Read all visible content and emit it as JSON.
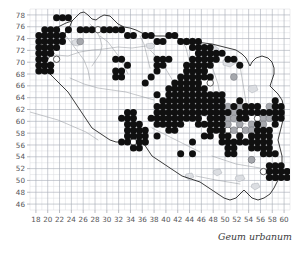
{
  "figure": {
    "caption": "Geum urbanum",
    "type": "species-distribution-grid-map"
  },
  "axes": {
    "x_ticks": [
      18,
      20,
      22,
      24,
      26,
      28,
      30,
      32,
      34,
      36,
      38,
      40,
      42,
      44,
      46,
      48,
      50,
      52,
      54,
      56,
      58,
      60
    ],
    "y_ticks": [
      78,
      76,
      74,
      72,
      70,
      68,
      66,
      64,
      62,
      60,
      58,
      56,
      54,
      52,
      50,
      48,
      46
    ],
    "x_range": [
      17,
      61
    ],
    "y_range": [
      45,
      79
    ],
    "grid": "on",
    "xlabel": "",
    "ylabel": ""
  },
  "legend": {
    "symbols": [
      {
        "name": "filled",
        "color": "#101010",
        "meaning": "recorded"
      },
      {
        "name": "gray",
        "color": "#a6a8ad",
        "meaning": "uncertain"
      },
      {
        "name": "open",
        "color": "#ffffff",
        "meaning": "old record"
      }
    ]
  },
  "chart_data": {
    "type": "scatter",
    "title": "Geum urbanum",
    "xlabel": "",
    "ylabel": "",
    "xlim": [
      17,
      61
    ],
    "ylim": [
      45,
      79
    ],
    "grid": true,
    "legend_position": "none",
    "series": [
      {
        "name": "filled",
        "marker": "filled-circle",
        "color": "#101010",
        "points": [
          [
            21,
            77
          ],
          [
            22,
            77
          ],
          [
            23,
            77
          ],
          [
            19,
            75
          ],
          [
            20,
            75
          ],
          [
            21,
            75
          ],
          [
            23,
            75
          ],
          [
            25,
            75
          ],
          [
            26,
            75
          ],
          [
            27,
            75
          ],
          [
            29,
            75
          ],
          [
            30,
            75
          ],
          [
            31,
            75
          ],
          [
            32,
            75
          ],
          [
            18,
            74
          ],
          [
            19,
            74
          ],
          [
            20,
            74
          ],
          [
            21,
            74
          ],
          [
            22,
            74
          ],
          [
            33,
            74
          ],
          [
            34,
            74
          ],
          [
            36,
            74
          ],
          [
            37,
            74
          ],
          [
            40,
            74
          ],
          [
            41,
            74
          ],
          [
            18,
            73
          ],
          [
            19,
            73
          ],
          [
            20,
            73
          ],
          [
            21,
            73
          ],
          [
            22,
            73
          ],
          [
            38,
            73
          ],
          [
            39,
            73
          ],
          [
            42,
            73
          ],
          [
            43,
            73
          ],
          [
            44,
            73
          ],
          [
            45,
            73
          ],
          [
            18,
            72
          ],
          [
            19,
            72
          ],
          [
            20,
            72
          ],
          [
            21,
            72
          ],
          [
            44,
            72
          ],
          [
            45,
            72
          ],
          [
            46,
            72
          ],
          [
            47,
            72
          ],
          [
            18,
            71
          ],
          [
            19,
            71
          ],
          [
            20,
            71
          ],
          [
            45,
            71
          ],
          [
            46,
            71
          ],
          [
            47,
            71
          ],
          [
            48,
            71
          ],
          [
            49,
            71
          ],
          [
            18,
            70
          ],
          [
            19,
            70
          ],
          [
            31,
            70
          ],
          [
            32,
            70
          ],
          [
            38,
            70
          ],
          [
            39,
            70
          ],
          [
            40,
            70
          ],
          [
            44,
            70
          ],
          [
            45,
            70
          ],
          [
            46,
            70
          ],
          [
            47,
            70
          ],
          [
            48,
            70
          ],
          [
            50,
            70
          ],
          [
            51,
            70
          ],
          [
            18,
            69
          ],
          [
            19,
            69
          ],
          [
            20,
            69
          ],
          [
            33,
            69
          ],
          [
            38,
            69
          ],
          [
            39,
            69
          ],
          [
            43,
            69
          ],
          [
            44,
            69
          ],
          [
            45,
            69
          ],
          [
            46,
            69
          ],
          [
            47,
            69
          ],
          [
            52,
            69
          ],
          [
            18,
            68
          ],
          [
            19,
            68
          ],
          [
            20,
            68
          ],
          [
            31,
            68
          ],
          [
            32,
            68
          ],
          [
            38,
            68
          ],
          [
            43,
            68
          ],
          [
            44,
            68
          ],
          [
            45,
            68
          ],
          [
            46,
            68
          ],
          [
            31,
            67
          ],
          [
            32,
            67
          ],
          [
            37,
            67
          ],
          [
            42,
            67
          ],
          [
            43,
            67
          ],
          [
            44,
            67
          ],
          [
            45,
            67
          ],
          [
            46,
            67
          ],
          [
            47,
            67
          ],
          [
            36,
            66
          ],
          [
            41,
            66
          ],
          [
            42,
            66
          ],
          [
            43,
            66
          ],
          [
            44,
            66
          ],
          [
            45,
            66
          ],
          [
            40,
            65
          ],
          [
            41,
            65
          ],
          [
            42,
            65
          ],
          [
            43,
            65
          ],
          [
            44,
            65
          ],
          [
            45,
            65
          ],
          [
            46,
            65
          ],
          [
            38,
            64
          ],
          [
            40,
            64
          ],
          [
            41,
            64
          ],
          [
            42,
            64
          ],
          [
            43,
            64
          ],
          [
            44,
            64
          ],
          [
            45,
            64
          ],
          [
            46,
            64
          ],
          [
            47,
            64
          ],
          [
            48,
            64
          ],
          [
            49,
            64
          ],
          [
            39,
            63
          ],
          [
            40,
            63
          ],
          [
            41,
            63
          ],
          [
            42,
            63
          ],
          [
            43,
            63
          ],
          [
            44,
            63
          ],
          [
            45,
            63
          ],
          [
            46,
            63
          ],
          [
            47,
            63
          ],
          [
            48,
            63
          ],
          [
            49,
            63
          ],
          [
            52,
            63
          ],
          [
            58,
            63
          ],
          [
            38,
            62
          ],
          [
            39,
            62
          ],
          [
            40,
            62
          ],
          [
            41,
            62
          ],
          [
            42,
            62
          ],
          [
            43,
            62
          ],
          [
            44,
            62
          ],
          [
            45,
            62
          ],
          [
            46,
            62
          ],
          [
            47,
            62
          ],
          [
            48,
            62
          ],
          [
            49,
            62
          ],
          [
            51,
            62
          ],
          [
            53,
            62
          ],
          [
            54,
            62
          ],
          [
            55,
            62
          ],
          [
            58,
            62
          ],
          [
            59,
            62
          ],
          [
            33,
            61
          ],
          [
            34,
            61
          ],
          [
            38,
            61
          ],
          [
            39,
            61
          ],
          [
            40,
            61
          ],
          [
            41,
            61
          ],
          [
            42,
            61
          ],
          [
            43,
            61
          ],
          [
            44,
            61
          ],
          [
            45,
            61
          ],
          [
            46,
            61
          ],
          [
            47,
            61
          ],
          [
            48,
            61
          ],
          [
            49,
            61
          ],
          [
            50,
            61
          ],
          [
            52,
            61
          ],
          [
            53,
            61
          ],
          [
            54,
            61
          ],
          [
            55,
            61
          ],
          [
            56,
            61
          ],
          [
            57,
            61
          ],
          [
            58,
            61
          ],
          [
            59,
            61
          ],
          [
            32,
            60
          ],
          [
            33,
            60
          ],
          [
            34,
            60
          ],
          [
            37,
            60
          ],
          [
            38,
            60
          ],
          [
            39,
            60
          ],
          [
            40,
            60
          ],
          [
            41,
            60
          ],
          [
            42,
            60
          ],
          [
            43,
            60
          ],
          [
            44,
            60
          ],
          [
            45,
            60
          ],
          [
            47,
            60
          ],
          [
            48,
            60
          ],
          [
            49,
            60
          ],
          [
            52,
            60
          ],
          [
            53,
            60
          ],
          [
            58,
            60
          ],
          [
            59,
            60
          ],
          [
            33,
            59
          ],
          [
            34,
            59
          ],
          [
            35,
            59
          ],
          [
            38,
            59
          ],
          [
            39,
            59
          ],
          [
            40,
            59
          ],
          [
            41,
            59
          ],
          [
            42,
            59
          ],
          [
            45,
            59
          ],
          [
            46,
            59
          ],
          [
            47,
            59
          ],
          [
            48,
            59
          ],
          [
            49,
            59
          ],
          [
            55,
            59
          ],
          [
            58,
            59
          ],
          [
            33,
            58
          ],
          [
            34,
            58
          ],
          [
            35,
            58
          ],
          [
            36,
            58
          ],
          [
            40,
            58
          ],
          [
            41,
            58
          ],
          [
            47,
            58
          ],
          [
            48,
            58
          ],
          [
            49,
            58
          ],
          [
            55,
            58
          ],
          [
            56,
            58
          ],
          [
            57,
            58
          ],
          [
            33,
            57
          ],
          [
            34,
            57
          ],
          [
            35,
            57
          ],
          [
            36,
            57
          ],
          [
            38,
            57
          ],
          [
            46,
            57
          ],
          [
            47,
            57
          ],
          [
            49,
            57
          ],
          [
            50,
            57
          ],
          [
            52,
            57
          ],
          [
            54,
            57
          ],
          [
            55,
            57
          ],
          [
            56,
            57
          ],
          [
            57,
            57
          ],
          [
            32,
            56
          ],
          [
            33,
            56
          ],
          [
            35,
            56
          ],
          [
            36,
            56
          ],
          [
            44,
            56
          ],
          [
            49,
            56
          ],
          [
            50,
            56
          ],
          [
            51,
            56
          ],
          [
            52,
            56
          ],
          [
            53,
            56
          ],
          [
            54,
            56
          ],
          [
            55,
            56
          ],
          [
            56,
            56
          ],
          [
            57,
            56
          ],
          [
            34,
            55
          ],
          [
            35,
            55
          ],
          [
            50,
            55
          ],
          [
            51,
            55
          ],
          [
            54,
            55
          ],
          [
            55,
            55
          ],
          [
            56,
            55
          ],
          [
            57,
            55
          ],
          [
            42,
            54
          ],
          [
            44,
            54
          ],
          [
            50,
            54
          ],
          [
            51,
            54
          ],
          [
            56,
            54
          ],
          [
            57,
            54
          ],
          [
            58,
            54
          ],
          [
            57,
            52
          ],
          [
            58,
            52
          ],
          [
            59,
            52
          ],
          [
            57,
            51
          ],
          [
            58,
            51
          ],
          [
            59,
            51
          ],
          [
            60,
            51
          ],
          [
            57,
            50
          ],
          [
            58,
            50
          ],
          [
            59,
            50
          ],
          [
            60,
            50
          ]
        ]
      },
      {
        "name": "gray",
        "marker": "gray-circle",
        "color": "#a6a8ad",
        "points": [
          [
            25,
            73
          ],
          [
            48,
            70
          ],
          [
            51,
            67
          ],
          [
            50,
            62
          ],
          [
            51,
            61
          ],
          [
            52,
            62
          ],
          [
            53,
            61
          ],
          [
            55,
            62
          ],
          [
            57,
            62
          ],
          [
            50,
            60
          ],
          [
            51,
            60
          ],
          [
            53,
            60
          ],
          [
            56,
            60
          ],
          [
            57,
            60
          ],
          [
            50,
            59
          ],
          [
            52,
            59
          ],
          [
            54,
            59
          ],
          [
            56,
            59
          ],
          [
            51,
            58
          ],
          [
            53,
            58
          ],
          [
            54,
            58
          ],
          [
            52,
            57
          ],
          [
            53,
            56
          ],
          [
            54,
            53
          ]
        ]
      },
      {
        "name": "open",
        "marker": "open-circle",
        "color": "#ffffff",
        "points": [
          [
            20,
            71
          ],
          [
            21,
            70
          ],
          [
            20,
            69
          ],
          [
            28,
            75
          ],
          [
            43,
            73
          ],
          [
            44,
            73
          ],
          [
            46,
            71
          ],
          [
            46,
            68
          ],
          [
            47,
            66
          ],
          [
            42,
            64
          ],
          [
            44,
            63
          ],
          [
            48,
            61
          ],
          [
            50,
            58
          ],
          [
            52,
            58
          ],
          [
            54,
            57
          ],
          [
            55,
            60
          ],
          [
            34,
            56
          ],
          [
            36,
            56
          ],
          [
            54,
            53
          ],
          [
            56,
            51
          ],
          [
            58,
            50
          ]
        ]
      }
    ]
  }
}
